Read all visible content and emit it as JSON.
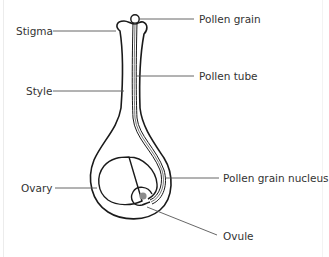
{
  "diagram": {
    "colors": {
      "outline": "#1a1a1a",
      "leader": "#555555",
      "nucleus": "#8c8c8c",
      "text": "#333333",
      "background": "#ffffff"
    },
    "labels": {
      "pollen_grain": "Pollen grain",
      "stigma": "Stigma",
      "pollen_tube": "Pollen tube",
      "style": "Style",
      "pollen_grain_nucleus": "Pollen grain nucleus",
      "ovary": "Ovary",
      "ovule": "Ovule"
    }
  }
}
